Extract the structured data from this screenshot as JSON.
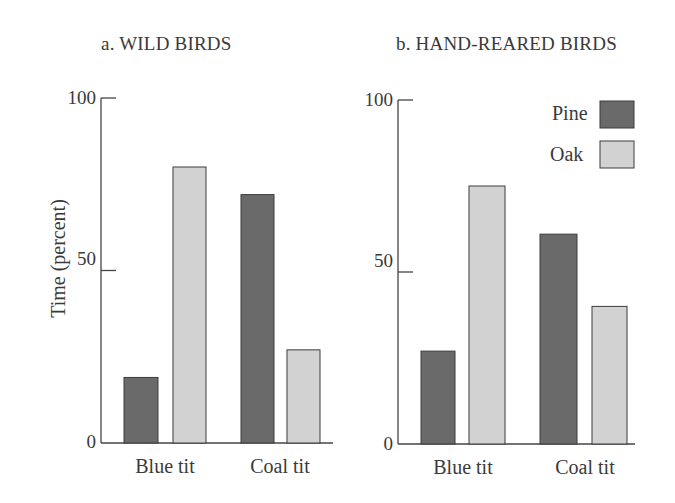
{
  "colors": {
    "pine": "#6a6a6a",
    "oak": "#d2d2d2",
    "axis": "#444444",
    "bar_border": "#3c3c3c"
  },
  "chart_data": [
    {
      "type": "bar",
      "title": "a.  WILD BIRDS",
      "xlabel": "",
      "ylabel": "Time (percent)",
      "ylim": [
        0,
        100
      ],
      "yticks": [
        0,
        50,
        100
      ],
      "grid": false,
      "legend_position": "none",
      "categories": [
        "Blue tit",
        "Coal tit"
      ],
      "series": [
        {
          "name": "Pine",
          "values": [
            19,
            72
          ]
        },
        {
          "name": "Oak",
          "values": [
            80,
            27
          ]
        }
      ]
    },
    {
      "type": "bar",
      "title": "b.  HAND-REARED BIRDS",
      "xlabel": "",
      "ylabel": "",
      "ylim": [
        0,
        100
      ],
      "yticks": [
        0,
        50,
        100
      ],
      "grid": false,
      "legend_position": "upper right",
      "categories": [
        "Blue tit",
        "Coal tit"
      ],
      "series": [
        {
          "name": "Pine",
          "values": [
            27,
            61
          ]
        },
        {
          "name": "Oak",
          "values": [
            75,
            40
          ]
        }
      ]
    }
  ],
  "legend": {
    "items": [
      {
        "label": "Pine"
      },
      {
        "label": "Oak"
      }
    ]
  }
}
